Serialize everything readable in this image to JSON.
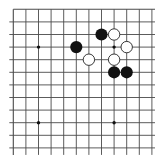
{
  "board": {
    "visible_cols": 12,
    "visible_rows": 12,
    "edges": {
      "top": true,
      "left": true,
      "right": false,
      "bottom": false
    },
    "colors": {
      "background": "#ffffff",
      "line": "#4a4a4a",
      "black_stone": "#111111",
      "white_stone": "#ffffff",
      "white_outline": "#222222",
      "star_point": "#111111"
    },
    "star_points": [
      {
        "col": 2,
        "row": 3
      },
      {
        "col": 8,
        "row": 3
      },
      {
        "col": 2,
        "row": 9
      },
      {
        "col": 8,
        "row": 9
      }
    ],
    "stones": [
      {
        "color": "black",
        "col": 7,
        "row": 2
      },
      {
        "color": "white",
        "col": 8,
        "row": 2
      },
      {
        "color": "black",
        "col": 5,
        "row": 3
      },
      {
        "color": "white",
        "col": 9,
        "row": 3
      },
      {
        "color": "white",
        "col": 6,
        "row": 4
      },
      {
        "color": "white",
        "col": 8,
        "row": 4
      },
      {
        "color": "black",
        "col": 8,
        "row": 5
      },
      {
        "color": "black",
        "col": 9,
        "row": 5
      }
    ]
  }
}
